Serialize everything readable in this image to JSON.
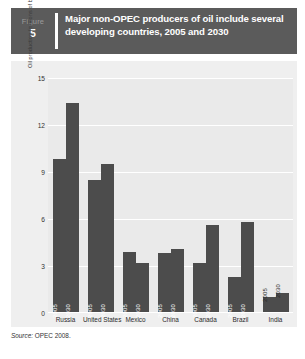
{
  "figure": {
    "label_word": "Figure",
    "label_number": "5",
    "title": "Major non-OPEC producers of oil include several developing countries, 2005 and 2030"
  },
  "source": {
    "prefix": "Source:",
    "text": "OPEC 2008."
  },
  "chart_data": {
    "type": "bar",
    "title": "Major non-OPEC producers of oil include several developing countries, 2005 and 2030",
    "xlabel": "",
    "ylabel": "Oil production (millions of barrels of oil equivalent per day)",
    "ylim": [
      0,
      15
    ],
    "yticks": [
      "0",
      "3",
      "6",
      "9",
      "12",
      "15"
    ],
    "grid": true,
    "legend": "none",
    "bar_labels_inside": true,
    "categories": [
      "Russia",
      "United States",
      "Mexico",
      "China",
      "Canada",
      "Brazil",
      "India"
    ],
    "series": [
      {
        "name": "2005",
        "values": [
          9.8,
          8.5,
          3.9,
          3.8,
          3.2,
          2.3,
          1.0
        ]
      },
      {
        "name": "2030",
        "values": [
          13.4,
          9.5,
          3.2,
          4.1,
          5.6,
          5.8,
          1.3
        ]
      }
    ],
    "bar_color": "#4c4c4c",
    "plot_background": "#eaeaea",
    "gridline_color": "#ffffff"
  }
}
